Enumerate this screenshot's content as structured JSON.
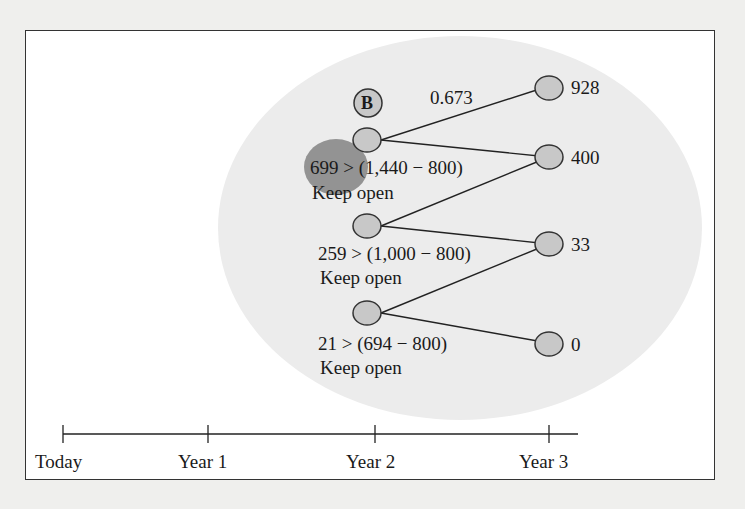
{
  "diagram": {
    "highlight_label": "B",
    "branch_probability": "0.673",
    "year2_nodes": [
      {
        "condition": "699 > (1,440 − 800)",
        "decision": "Keep open"
      },
      {
        "condition": "259 > (1,000 − 800)",
        "decision": "Keep open"
      },
      {
        "condition": "21 > (694 − 800)",
        "decision": "Keep open"
      }
    ],
    "year3_nodes": [
      {
        "value": "928"
      },
      {
        "value": "400"
      },
      {
        "value": "33"
      },
      {
        "value": "0"
      }
    ],
    "timeline": {
      "ticks": [
        "Today",
        "Year 1",
        "Year 2",
        "Year 3"
      ]
    },
    "colors": {
      "node_fill": "#c8c8c8",
      "node_stroke": "#333333",
      "highlight_fill": "#8e8e8e",
      "ellipse_bg": "#ececec",
      "frame_bg": "#ffffff",
      "page_bg": "#efefed"
    }
  }
}
